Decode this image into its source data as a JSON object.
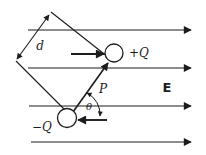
{
  "diagram": {
    "type": "electric-dipole-in-uniform-field",
    "labels": {
      "separation": "d",
      "dipole_moment": "P",
      "angle": "θ",
      "positive_charge": "+Q",
      "negative_charge": "−Q",
      "electric_field": "E"
    },
    "colors": {
      "ink": "#1c1c1c",
      "background": "#ffffff"
    },
    "geometry": {
      "canvas": {
        "w": 206,
        "h": 155
      },
      "field_lines": [
        {
          "name": "field-line-1",
          "x1": 28,
          "y1": 30,
          "x2": 191,
          "y2": 30
        },
        {
          "name": "field-line-2",
          "x1": 28,
          "y1": 68,
          "x2": 191,
          "y2": 68
        },
        {
          "name": "field-line-3",
          "x1": 29,
          "y1": 106,
          "x2": 191,
          "y2": 106
        },
        {
          "name": "field-line-4",
          "x1": 31,
          "y1": 142,
          "x2": 191,
          "y2": 142
        }
      ],
      "construction_lines": [
        {
          "name": "upper-parallel-line",
          "x1": 51,
          "y1": 12,
          "x2": 108,
          "y2": 57
        },
        {
          "name": "lower-parallel-line",
          "x1": 16,
          "y1": 61,
          "x2": 70,
          "y2": 115
        }
      ],
      "separation_arrow": {
        "name": "separation-dimension-arrow",
        "x1": 49,
        "y1": 15,
        "x2": 17,
        "y2": 59
      },
      "dipole_moment_arrow": {
        "name": "dipole-moment-vector",
        "x1": 73,
        "y1": 112,
        "x2": 108,
        "y2": 63
      },
      "force_arrows": [
        {
          "name": "force-on-positive-charge",
          "x1": 71,
          "y1": 54,
          "x2": 104,
          "y2": 54
        },
        {
          "name": "force-on-negative-charge",
          "x1": 107,
          "y1": 120,
          "x2": 78,
          "y2": 120
        }
      ],
      "angle_arc": {
        "name": "angle-arc",
        "path": "M 87 93 A 24 24 0 0 1 100 116"
      },
      "charges": [
        {
          "name": "positive-charge-circle",
          "cx": 114,
          "cy": 53,
          "r": 9
        },
        {
          "name": "negative-charge-circle",
          "cx": 67,
          "cy": 118,
          "r": 9.5
        }
      ]
    }
  }
}
